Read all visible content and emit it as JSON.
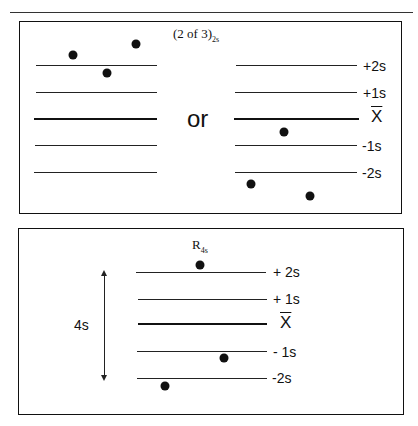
{
  "panels": [
    {
      "title": "(2 of 3)",
      "title_sub": "2s",
      "connector": "or",
      "levels": [
        "+2s",
        "+1s",
        "X",
        "-1s",
        "-2s"
      ],
      "mean_symbol": "X̄",
      "left_points": [
        {
          "x": 73,
          "y": 55
        },
        {
          "x": 107,
          "y": 73
        },
        {
          "x": 136,
          "y": 44
        }
      ],
      "right_points": [
        {
          "x": 284,
          "y": 132
        },
        {
          "x": 251,
          "y": 184
        },
        {
          "x": 310,
          "y": 196
        }
      ]
    },
    {
      "title": "R",
      "title_sub": "4s",
      "levels": [
        "+ 2s",
        "+ 1s",
        "X",
        "- 1s",
        "-2s"
      ],
      "range_label": "4s",
      "points": [
        {
          "x": 200,
          "y": 265
        },
        {
          "x": 224,
          "y": 358
        },
        {
          "x": 165,
          "y": 386
        }
      ]
    }
  ]
}
